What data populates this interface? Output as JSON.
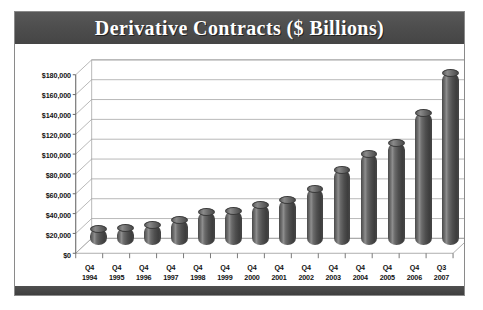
{
  "chart": {
    "title": "Derivative Contracts ($ Billions)",
    "colors": {
      "title_band": "#4e4e4e",
      "title_text": "#ffffff",
      "bar": "#4a4a4a",
      "gridline": "#9a9a9a",
      "frame": "#8a8a8a",
      "background": "#ffffff"
    }
  },
  "chart_data": {
    "type": "bar",
    "title": "Derivative Contracts ($ Billions)",
    "xlabel": "",
    "ylabel": "",
    "ylim": [
      0,
      180000
    ],
    "ytick_labels": [
      "$180,000",
      "$160,000",
      "$140,000",
      "$120,000",
      "$100,000",
      "$80,000",
      "$60,000",
      "$40,000",
      "$20,000",
      "$0"
    ],
    "ytick_values": [
      180000,
      160000,
      140000,
      120000,
      100000,
      80000,
      60000,
      40000,
      20000,
      0
    ],
    "grid": true,
    "legend": false,
    "style": "3d-cylinder",
    "categories": [
      "Q4 1994",
      "Q4 1995",
      "Q4 1996",
      "Q4 1997",
      "Q4 1998",
      "Q4 1999",
      "Q4 2000",
      "Q4 2001",
      "Q4 2002",
      "Q4 2003",
      "Q4 2004",
      "Q4 2005",
      "Q4 2006",
      "Q3 2007"
    ],
    "category_lines": [
      [
        "Q4",
        "1994"
      ],
      [
        "Q4",
        "1995"
      ],
      [
        "Q4",
        "1996"
      ],
      [
        "Q4",
        "1997"
      ],
      [
        "Q4",
        "1998"
      ],
      [
        "Q4",
        "1999"
      ],
      [
        "Q4",
        "2000"
      ],
      [
        "Q4",
        "2001"
      ],
      [
        "Q4",
        "2002"
      ],
      [
        "Q4",
        "2003"
      ],
      [
        "Q4",
        "2004"
      ],
      [
        "Q4",
        "2005"
      ],
      [
        "Q4",
        "2006"
      ],
      [
        "Q3",
        "2007"
      ]
    ],
    "values": [
      16000,
      17000,
      20000,
      25000,
      33000,
      34000,
      40000,
      45000,
      56000,
      75000,
      91000,
      102000,
      132000,
      172000
    ]
  }
}
